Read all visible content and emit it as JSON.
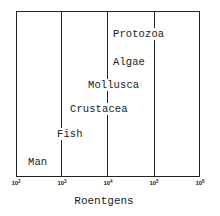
{
  "chart_data": {
    "type": "range-label",
    "title": "",
    "xlabel": "Roentgens",
    "ylabel": "",
    "x_scale": "log10",
    "xlim_exponent": [
      2,
      6
    ],
    "x_ticks": [
      {
        "base": "10",
        "exp": "2"
      },
      {
        "base": "10",
        "exp": "3"
      },
      {
        "base": "10",
        "exp": "4"
      },
      {
        "base": "10",
        "exp": "5"
      },
      {
        "base": "10",
        "exp": "6"
      }
    ],
    "grid": "vertical lines at each decade",
    "items": [
      {
        "label": "Protozoa",
        "left_px": 112,
        "top_px": 28,
        "approx_log10_center": 4.63
      },
      {
        "label": "Algae",
        "left_px": 112,
        "top_px": 56,
        "approx_log10_center": 4.37
      },
      {
        "label": "Mollusca",
        "left_px": 87,
        "top_px": 79,
        "approx_log10_center": 4.15
      },
      {
        "label": "Crustacea",
        "left_px": 69,
        "top_px": 103,
        "approx_log10_center": 3.85
      },
      {
        "label": "Fish",
        "left_px": 56,
        "top_px": 128,
        "approx_log10_center": 3.17
      },
      {
        "label": "Man",
        "left_px": 27,
        "top_px": 156,
        "approx_log10_center": 2.48
      }
    ]
  },
  "colors": {
    "line": "#222222",
    "text": "#1a1a1a",
    "background": "#ffffff"
  }
}
